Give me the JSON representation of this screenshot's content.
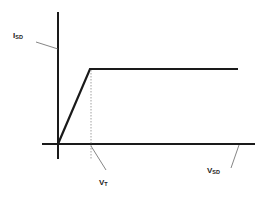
{
  "diagram": {
    "type": "IV-characteristic",
    "y_axis_label": {
      "main": "I",
      "sub": "SD"
    },
    "x_axis_label": {
      "main": "V",
      "sub": "SD"
    },
    "threshold_label": {
      "main": "V",
      "sub": "T"
    },
    "colors": {
      "line": "#1a1a1a",
      "leader": "#666666",
      "dotted": "#888888"
    }
  }
}
